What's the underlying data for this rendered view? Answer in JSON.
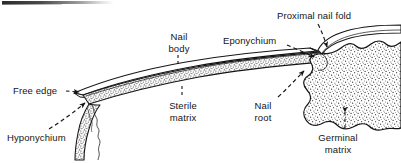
{
  "figure": {
    "kind": "labeled line diagram",
    "colors": {
      "ink": "#151515",
      "paper": "#ffffff",
      "stipple": "#3a3a3a",
      "nail_plate_fill": "#ffffff",
      "matrix_fill": "#f2f2f2"
    },
    "artifact": {
      "name": "scan-smudge-bar",
      "description": "dark horizontal scanning smudge along the top-left edge"
    },
    "labels": [
      {
        "id": "proximal_nail_fold",
        "text": "Proximal nail fold",
        "lines": [
          "Proximal nail fold"
        ],
        "x": 277,
        "y": 10,
        "align": "left",
        "leader": "dashed-arrow-down"
      },
      {
        "id": "eponychium",
        "text": "Eponychium",
        "lines": [
          "Eponychium"
        ],
        "x": 223,
        "y": 35,
        "align": "left",
        "leader": "dashed-arrow-down-right"
      },
      {
        "id": "nail_body",
        "text": "Nail body",
        "lines": [
          "Nail",
          "body"
        ],
        "x": 163,
        "y": 31,
        "align": "center",
        "leader": "dashed-tick-down"
      },
      {
        "id": "free_edge",
        "text": "Free edge",
        "lines": [
          "Free edge"
        ],
        "x": 13,
        "y": 85,
        "align": "left",
        "leader": "dashed-arrow-right"
      },
      {
        "id": "hyponychium",
        "text": "Hyponychium",
        "lines": [
          "Hyponychium"
        ],
        "x": 7,
        "y": 132,
        "align": "left",
        "leader": "dashed-arrow-up-right"
      },
      {
        "id": "sterile_matrix",
        "text": "Sterile matrix",
        "lines": [
          "Sterile",
          "matrix"
        ],
        "x": 172,
        "y": 100,
        "align": "center",
        "leader": "dashed-tick-up"
      },
      {
        "id": "nail_root",
        "text": "Nail root",
        "lines": [
          "Nail",
          "root"
        ],
        "x": 262,
        "y": 100,
        "align": "center",
        "leader": "dashed-arrow-up-right"
      },
      {
        "id": "germinal_matrix",
        "text": "Germinal matrix",
        "lines": [
          "Germinal",
          "matrix"
        ],
        "x": 312,
        "y": 132,
        "align": "center",
        "leader": "dashed-tick-up"
      }
    ]
  }
}
